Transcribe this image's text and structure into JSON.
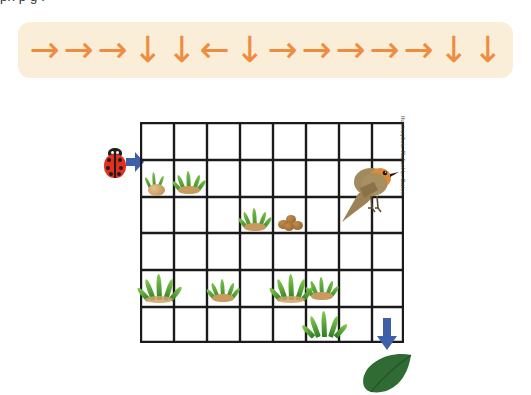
{
  "page": {
    "width": 531,
    "height": 395,
    "background": "#ffffff",
    "clipped_top_text": "pri             p                 g                                      ."
  },
  "arrow_strip": {
    "background": "#fbeed8",
    "arrow_color": "#ef8c3f",
    "sequence": [
      {
        "direction": "right",
        "glyph": "→"
      },
      {
        "direction": "right",
        "glyph": "→"
      },
      {
        "direction": "right",
        "glyph": "→"
      },
      {
        "direction": "down",
        "glyph": "↓"
      },
      {
        "direction": "down",
        "glyph": "↓"
      },
      {
        "direction": "left",
        "glyph": "←"
      },
      {
        "direction": "down",
        "glyph": "↓"
      },
      {
        "direction": "right",
        "glyph": "→"
      },
      {
        "direction": "right",
        "glyph": "→"
      },
      {
        "direction": "right",
        "glyph": "→"
      },
      {
        "direction": "right",
        "glyph": "→"
      },
      {
        "direction": "right",
        "glyph": "→"
      },
      {
        "direction": "down",
        "glyph": "↓"
      },
      {
        "direction": "down",
        "glyph": "↓"
      }
    ],
    "count": 14
  },
  "grid": {
    "columns": 8,
    "rows": 6,
    "line_color": "#1a1a1a",
    "cell_width": 33,
    "cell_height": 36.83,
    "contents": [
      {
        "row": 1,
        "col": 0,
        "kind": "sprout"
      },
      {
        "row": 1,
        "col": 1,
        "kind": "grass"
      },
      {
        "row": 2,
        "col": 3,
        "kind": "grass"
      },
      {
        "row": 2,
        "col": 4,
        "kind": "pebbles"
      },
      {
        "row": 4,
        "col": 0,
        "kind": "grass-big"
      },
      {
        "row": 4,
        "col": 2,
        "kind": "grass"
      },
      {
        "row": 4,
        "col": 4,
        "kind": "grass-big"
      },
      {
        "row": 4,
        "col": 5,
        "kind": "grass"
      },
      {
        "row": 5,
        "col": 5,
        "kind": "grass-big"
      }
    ]
  },
  "characters": {
    "ladybug": {
      "label": "ladybug",
      "body_color": "#e12f20",
      "spot_color": "#1d1d1d"
    },
    "bird": {
      "label": "robin",
      "body_color": "#9a8159",
      "breast_color": "#d98c3c"
    },
    "leaf": {
      "label": "leaf",
      "color": "#2f6b33"
    }
  },
  "markers": {
    "entry_arrow": {
      "direction": "right",
      "color": "#3f5fa8"
    },
    "exit_arrow": {
      "direction": "down",
      "color": "#3f5fa8"
    }
  },
  "credit": {
    "text": "Ilustrações: Rafael L. Gaion"
  }
}
